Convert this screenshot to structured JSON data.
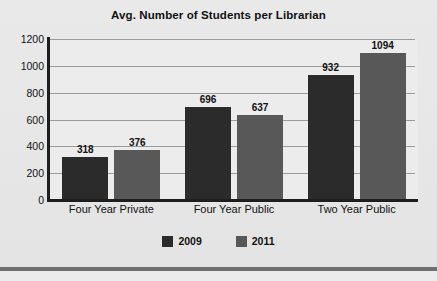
{
  "chart_data": {
    "type": "bar",
    "title": "Avg. Number of Students per Librarian",
    "xlabel": "",
    "ylabel": "",
    "ylim": [
      0,
      1200
    ],
    "yticks": [
      0,
      200,
      400,
      600,
      800,
      1000,
      1200
    ],
    "ytick_labels": [
      "0",
      "200",
      "400",
      "600",
      "800",
      "1000",
      "1200"
    ],
    "grid": true,
    "legend_position": "bottom-center",
    "categories": [
      "Four Year Private",
      "Four Year Public",
      "Two Year Public"
    ],
    "series": [
      {
        "name": "2009",
        "color": "#2b2b2b",
        "values": [
          318,
          696,
          932
        ]
      },
      {
        "name": "2011",
        "color": "#585858",
        "values": [
          376,
          637,
          1094
        ]
      }
    ],
    "data_labels": [
      [
        "318",
        "376"
      ],
      [
        "696",
        "637"
      ],
      [
        "932",
        "1094"
      ]
    ]
  },
  "legend": {
    "items": [
      {
        "label": "2009",
        "color": "#2b2b2b"
      },
      {
        "label": "2011",
        "color": "#585858"
      }
    ]
  },
  "colors": {
    "series_2009": "#2b2b2b",
    "series_2011": "#585858",
    "axis": "#1e1e1e",
    "grid": "#9a9a9a",
    "plot_background": "#ececec",
    "page_background": "#e8e8e8",
    "rule": "#6f6f6f"
  }
}
